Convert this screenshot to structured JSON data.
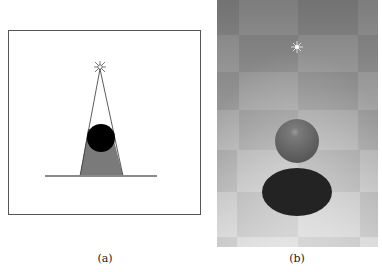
{
  "figure": {
    "panels": [
      {
        "id": "a",
        "caption": "(a)",
        "description": "Schematic: point light above a sphere casting a trapezoidal shadow onto a ground line",
        "colors": {
          "border": "#555555",
          "shadow": "#7a7a7a",
          "sphere": "#000000",
          "ground": "#8a8a8a",
          "rays": "#444444"
        }
      },
      {
        "id": "b",
        "caption": "(b)",
        "description": "Rendered scene: light over a gray sphere casting a dark elliptical shadow on a checkerboard floor",
        "colors": {
          "sphere": "#6a6a6a",
          "shadow": "#232323",
          "light": "#ffffff"
        }
      }
    ]
  }
}
